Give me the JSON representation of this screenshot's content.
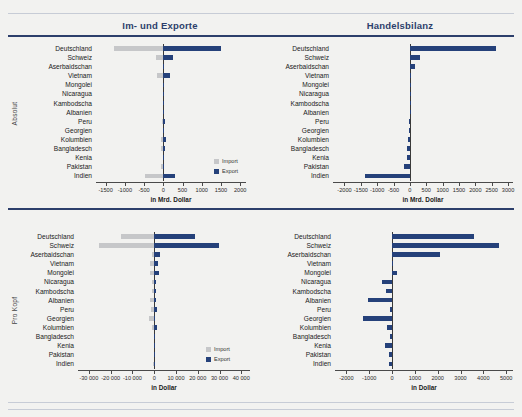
{
  "headers": {
    "left": "Im- und Exporte",
    "right": "Handelsbilanz"
  },
  "row_labels": {
    "top": "Absolut",
    "bottom": "Pro Kopf"
  },
  "legend": {
    "import": "Import",
    "export": "Export"
  },
  "axis_titles": {
    "mrd": "in Mrd. Dollar",
    "dollar": "in Dollar"
  },
  "chart_data": [
    {
      "id": "absolut-im-export",
      "type": "bar",
      "orientation": "horizontal",
      "title": "Im- und Exporte",
      "group": "Absolut",
      "xlabel": "in Mrd. Dollar",
      "ylabel": "",
      "xlim": [
        -1750,
        2150
      ],
      "ticks": [
        -1500,
        -1000,
        -500,
        0,
        500,
        1000,
        1500,
        2000
      ],
      "ticklabels": [
        "-1500",
        "-1000",
        "-500",
        "0",
        "500",
        "1000",
        "1500",
        "2000"
      ],
      "grid": false,
      "legend_position": "bottom-right",
      "categories": [
        "Deutschland",
        "Schweiz",
        "Aserbaidschan",
        "Vietnam",
        "Mongolei",
        "Nicaragua",
        "Kambodscha",
        "Albanien",
        "Peru",
        "Georgien",
        "Kolumbien",
        "Bangladesch",
        "Kenia",
        "Pakistan",
        "Indien"
      ],
      "series": [
        {
          "name": "Import",
          "values": [
            -1285,
            -184,
            -10,
            -170,
            -6,
            -7,
            -16,
            -5,
            -41,
            -9,
            -53,
            -50,
            -16,
            -52,
            -467
          ]
        },
        {
          "name": "Export",
          "values": [
            1509,
            247,
            22,
            162,
            7,
            5,
            14,
            3,
            48,
            3,
            61,
            37,
            6,
            24,
            292
          ]
        }
      ]
    },
    {
      "id": "absolut-handelsbilanz",
      "type": "bar",
      "orientation": "horizontal",
      "title": "Handelsbilanz",
      "group": "Absolut",
      "xlabel": "in Mrd. Dollar",
      "ylabel": "",
      "xlim": [
        -2350,
        3150
      ],
      "ticks": [
        -2000,
        -1500,
        -1000,
        -500,
        0,
        500,
        1000,
        1500,
        2000,
        2500,
        3000
      ],
      "ticklabels": [
        "-2000",
        "-1500",
        "-1000",
        "-500",
        "0",
        "500",
        "1000",
        "1500",
        "2000",
        "2500",
        "3000"
      ],
      "grid": false,
      "legend_position": "none",
      "categories": [
        "Deutschland",
        "Schweiz",
        "Aserbaidschan",
        "Vietnam",
        "Mongolei",
        "Nicaragua",
        "Kambodscha",
        "Albanien",
        "Peru",
        "Georgien",
        "Kolumbien",
        "Bangladesch",
        "Kenia",
        "Pakistan",
        "Indien"
      ],
      "series": [
        {
          "name": "Handelsbilanz",
          "values": [
            2643,
            308,
            160,
            18,
            4,
            -6,
            -8,
            -10,
            -13,
            -22,
            -52,
            -90,
            -80,
            -190,
            -1370
          ]
        }
      ]
    },
    {
      "id": "prokopf-im-export",
      "type": "bar",
      "orientation": "horizontal",
      "title": "Im- und Exporte",
      "group": "Pro Kopf",
      "xlabel": "in Dollar",
      "ylabel": "",
      "xlim": [
        -35000,
        44000
      ],
      "ticks": [
        -30000,
        -20000,
        -10000,
        0,
        10000,
        20000,
        30000,
        40000
      ],
      "ticklabels": [
        "-30 000",
        "-20 000",
        "-10 000",
        "0",
        "10 000",
        "20 000",
        "30 000",
        "40 000"
      ],
      "grid": false,
      "legend_position": "bottom-right",
      "categories": [
        "Deutschland",
        "Schweiz",
        "Aserbaidschan",
        "Vietnam",
        "Mongolei",
        "Nicaragua",
        "Kambodscha",
        "Albanien",
        "Peru",
        "Georgien",
        "Kolumbien",
        "Bangladesch",
        "Kenia",
        "Pakistan",
        "Indien"
      ],
      "series": [
        {
          "name": "Import",
          "values": [
            -15100,
            -25200,
            -1000,
            -1750,
            -1900,
            -1100,
            -1000,
            -1750,
            -1250,
            -2400,
            -1050,
            -300,
            -320,
            -230,
            -340
          ]
        },
        {
          "name": "Export",
          "values": [
            18700,
            29900,
            2800,
            1700,
            2200,
            800,
            900,
            700,
            1200,
            600,
            1100,
            230,
            120,
            110,
            210
          ]
        }
      ]
    },
    {
      "id": "prokopf-handelsbilanz",
      "type": "bar",
      "orientation": "horizontal",
      "title": "Handelsbilanz",
      "group": "Pro Kopf",
      "xlabel": "in Dollar",
      "ylabel": "",
      "xlim": [
        -2500,
        5300
      ],
      "ticks": [
        -2000,
        -1000,
        0,
        1000,
        2000,
        3000,
        4000,
        5000
      ],
      "ticklabels": [
        "-2000",
        "-1000",
        "0",
        "1000",
        "2000",
        "3000",
        "4000",
        "5000"
      ],
      "grid": false,
      "legend_position": "none",
      "categories": [
        "Deutschland",
        "Schweiz",
        "Aserbaidschan",
        "Vietnam",
        "Mongolei",
        "Nicaragua",
        "Kambodscha",
        "Albanien",
        "Peru",
        "Georgien",
        "Kolumbien",
        "Bangladesch",
        "Kenia",
        "Pakistan",
        "Indien"
      ],
      "series": [
        {
          "name": "Handelsbilanz",
          "values": [
            3580,
            4700,
            2120,
            40,
            230,
            -420,
            -260,
            -1050,
            -110,
            -1290,
            -230,
            -70,
            -300,
            -120,
            -130
          ]
        }
      ]
    }
  ]
}
